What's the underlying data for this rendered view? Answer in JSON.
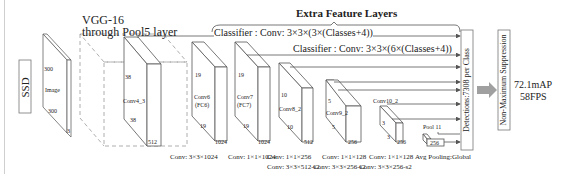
{
  "diagram": {
    "model_label": "SSD",
    "backbone": {
      "title_line1": "VGG-16",
      "title_line2": "through Pool5 layer"
    },
    "extra_feature_layers_title": "Extra Feature Layers",
    "classifiers": [
      "Classifier : Conv: 3×3×(3×(Classes+4))",
      "Classifier : Conv: 3×3×(6×(Classes+4))"
    ],
    "input": {
      "name": "Image",
      "width": "300",
      "height": "300",
      "depth": "3"
    },
    "layers": [
      {
        "name": "Conv4_3",
        "size_top": "38",
        "size_bottom": "38",
        "depth": "512",
        "op": "Conv: 3×3×1024",
        "op2": ""
      },
      {
        "name": "Conv6\n(FC6)",
        "name_l1": "Conv6",
        "name_l2": "(FC6)",
        "size_top": "19",
        "size_bottom": "19",
        "depth": "1024",
        "op": "Conv: 1×1×1024",
        "op2": ""
      },
      {
        "name_l1": "Conv7",
        "name_l2": "(FC7)",
        "size_top": "19",
        "size_bottom": "19",
        "depth": "1024",
        "op": "Conv: 1×1×256",
        "op2": "Conv: 3×3×512-s2"
      },
      {
        "name_l1": "Conv8_2",
        "size_top": "10",
        "size_bottom": "10",
        "depth": "512",
        "op": "Conv: 1×1×128",
        "op2": "Conv: 3×3×256-s2"
      },
      {
        "name_l1": "Conv9_2",
        "size_top": "5",
        "size_bottom": "5",
        "depth": "256",
        "op": "Conv: 1×1×128",
        "op2": "Conv: 3×3×256-s2"
      },
      {
        "name_l1": "Conv10_2",
        "size_top": "3",
        "size_bottom": "3",
        "depth": "256",
        "op": "Avg Pooling:Global",
        "op2": ""
      },
      {
        "name_l1": "Pool 11",
        "depth": "256"
      }
    ],
    "detections_label": "Detections:7308 per Class",
    "nms_label": "Non-Maximum Suppression",
    "result": {
      "map": "72.1mAP",
      "fps": "58FPS"
    },
    "colors": {
      "line": "#555555",
      "dashed": "#999999",
      "arrow_fill": "#a0a0a0"
    }
  }
}
